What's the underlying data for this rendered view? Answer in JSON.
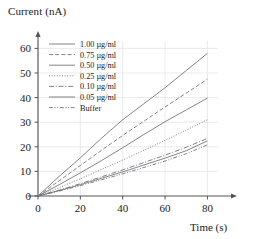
{
  "chart_data": {
    "type": "line",
    "title": "",
    "xlabel": "Time (s)",
    "ylabel": "Current (nA)",
    "xlim": [
      0,
      85
    ],
    "ylim": [
      0,
      63
    ],
    "xticks": [
      0,
      20,
      40,
      60,
      80
    ],
    "yticks": [
      0,
      10,
      20,
      30,
      40,
      50,
      60
    ],
    "grid": true,
    "legend_position": "upper-left",
    "x": [
      0,
      10,
      20,
      30,
      40,
      50,
      60,
      70,
      80
    ],
    "series": [
      {
        "name": "1.00 µg/ml",
        "style": "solid",
        "values": [
          0,
          8.0,
          15.5,
          23.5,
          31.0,
          37.5,
          44.0,
          51.0,
          58.0
        ]
      },
      {
        "name": "0.75 µg/ml",
        "style": "dashed",
        "values": [
          0,
          6.2,
          12.4,
          18.6,
          24.6,
          30.4,
          36.2,
          41.8,
          47.5
        ]
      },
      {
        "name": "0.50 µg/ml",
        "style": "solid",
        "values": [
          0,
          4.6,
          9.4,
          14.4,
          19.6,
          25.0,
          30.2,
          35.0,
          39.8
        ]
      },
      {
        "name": "0.25 µg/ml",
        "style": "dotted",
        "values": [
          0,
          3.4,
          7.0,
          10.8,
          14.6,
          18.6,
          22.6,
          26.8,
          31.0
        ]
      },
      {
        "name": "0.10 µg/ml",
        "style": "dashdot",
        "values": [
          0,
          2.4,
          5.0,
          7.8,
          10.6,
          13.6,
          16.6,
          19.8,
          23.4
        ]
      },
      {
        "name": "0.05 µg/ml",
        "style": "solid",
        "values": [
          0,
          2.2,
          4.6,
          7.2,
          9.8,
          12.6,
          15.4,
          18.4,
          22.4
        ]
      },
      {
        "name": "Buffer",
        "style": "dashdotdot",
        "values": [
          0,
          2.0,
          4.2,
          6.6,
          9.0,
          11.6,
          14.2,
          17.2,
          20.8
        ]
      }
    ]
  },
  "axes": {
    "y_title": "Current (nA)",
    "x_title": "Time (s)",
    "x_tick_labels": [
      "0",
      "20",
      "40",
      "60",
      "80"
    ],
    "y_tick_labels": [
      "0",
      "10",
      "20",
      "30",
      "40",
      "50",
      "60"
    ]
  },
  "legend": {
    "entries": [
      {
        "label": "1.00 µg/ml"
      },
      {
        "label": "0.75 µg/ml"
      },
      {
        "label": "0.50 µg/ml"
      },
      {
        "label": "0.25 µg/ml"
      },
      {
        "label": "0.10 µg/ml"
      },
      {
        "label": "0.05 µg/ml"
      },
      {
        "label": "Buffer"
      }
    ]
  },
  "colors": {
    "line": "#6e6e74",
    "axis": "#555555",
    "grid": "#e4e4e8",
    "text": "#1a1a1a",
    "background": "#ffffff"
  }
}
